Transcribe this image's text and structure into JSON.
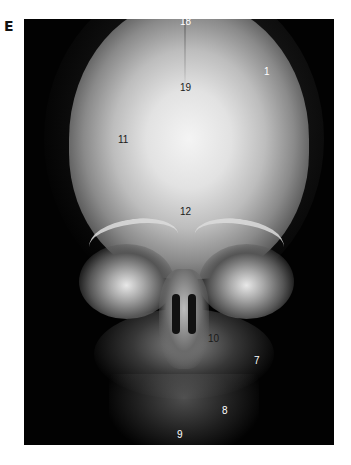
{
  "figure": {
    "panel_letter": "E",
    "labels": [
      {
        "id": "18",
        "text": "18",
        "x": 180,
        "y": 10,
        "tone": "light"
      },
      {
        "id": "1",
        "text": "1",
        "x": 264,
        "y": 52,
        "tone": "light"
      },
      {
        "id": "19",
        "text": "19",
        "x": 156,
        "y": 66,
        "tone": "dark"
      },
      {
        "id": "11",
        "text": "11",
        "x": 94,
        "y": 116,
        "tone": "dark"
      },
      {
        "id": "12",
        "text": "12",
        "x": 156,
        "y": 188,
        "tone": "dark"
      },
      {
        "id": "10",
        "text": "10",
        "x": 184,
        "y": 315,
        "tone": "dark"
      },
      {
        "id": "7",
        "text": "7",
        "x": 230,
        "y": 337,
        "tone": "light"
      },
      {
        "id": "8",
        "text": "8",
        "x": 198,
        "y": 387,
        "tone": "light"
      },
      {
        "id": "9",
        "text": "9",
        "x": 153,
        "y": 411,
        "tone": "light"
      }
    ]
  }
}
